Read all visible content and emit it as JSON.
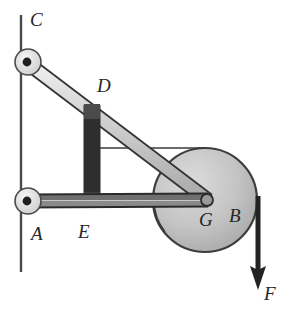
{
  "figure": {
    "type": "mechanism-diagram",
    "background_color": "#ffffff",
    "ink_color": "#262626",
    "canvas": {
      "width": 289,
      "height": 317
    }
  },
  "labels": {
    "c": "C",
    "d": "D",
    "a": "A",
    "e": "E",
    "g": "G",
    "b": "B",
    "f": "F"
  },
  "label_positions": {
    "c": {
      "x": 30,
      "y": 10
    },
    "d": {
      "x": 97,
      "y": 76
    },
    "a": {
      "x": 31,
      "y": 224
    },
    "e": {
      "x": 78,
      "y": 222
    },
    "g": {
      "x": 199,
      "y": 210
    },
    "b": {
      "x": 229,
      "y": 206
    },
    "f": {
      "x": 264,
      "y": 284
    }
  },
  "geometry": {
    "wall": {
      "x": 21,
      "y_top": 15,
      "y_bottom": 272,
      "color": "#4a4a4a",
      "width": 2.4
    },
    "joints": [
      {
        "name": "C",
        "x": 26,
        "y": 62,
        "radius": 13,
        "pin_radius": 4.2
      },
      {
        "name": "A",
        "x": 26,
        "y": 201,
        "radius": 13,
        "pin_radius": 4.2
      }
    ],
    "bars": [
      {
        "name": "CG",
        "from": "C",
        "to": "G",
        "x1": 26,
        "y1": 62,
        "x2": 206,
        "y2": 200,
        "thickness": 13,
        "fill": "#cfcfcf"
      },
      {
        "name": "AG",
        "from": "A",
        "to": "G",
        "x1": 26,
        "y1": 201,
        "x2": 206,
        "y2": 200,
        "thickness": 12,
        "fill": "#c9c9c9"
      },
      {
        "name": "DE",
        "from": "D",
        "to": "E",
        "x1": 92,
        "y1": 110,
        "x2": 92,
        "y2": 203,
        "thickness": 14,
        "fill": "#b5b5b5"
      }
    ],
    "nodes": [
      {
        "name": "D",
        "x": 92,
        "y": 110
      },
      {
        "name": "E",
        "x": 92,
        "y": 202
      },
      {
        "name": "G",
        "x": 206,
        "y": 200
      }
    ],
    "pulley": {
      "name": "B",
      "cx": 205,
      "cy": 200,
      "radius": 52,
      "fill": "#c6c6c6",
      "stroke": "#3d3d3d"
    },
    "reference_line": {
      "name": "horizontal-reference",
      "x1": 92,
      "y1": 148,
      "x2": 205,
      "y2": 148,
      "dot_x": 92,
      "dot_y": 148,
      "dot_radius": 4
    },
    "angle_arc": {
      "name": "angle-at-G",
      "cx": 206,
      "cy": 200,
      "radius": 52,
      "start_deg": 180,
      "end_deg": 218
    },
    "force_arrow": {
      "name": "F",
      "x": 258,
      "y_start": 196,
      "y_end": 288,
      "head_width": 13,
      "head_length": 20,
      "shaft_width": 5
    }
  }
}
